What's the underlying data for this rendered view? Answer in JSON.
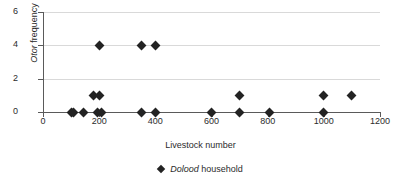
{
  "chart_data": {
    "type": "scatter",
    "title": "",
    "xlabel": "Livestock number",
    "ylabel_italic": "Otor",
    "ylabel_rest": " frequency",
    "ylabel": "Otor frequency",
    "xlim": [
      0,
      1200
    ],
    "ylim": [
      0,
      6
    ],
    "xticks": [
      0,
      200,
      400,
      600,
      800,
      1000,
      1200
    ],
    "xticklabels": [
      "0",
      "200",
      "400",
      "600",
      "800",
      "1000",
      "1200"
    ],
    "yticks": [
      0,
      2,
      4,
      6
    ],
    "yticklabels": [
      "0",
      "2",
      "4",
      "6"
    ],
    "gridlines_y": [
      2,
      4,
      6
    ],
    "grid": true,
    "legend_position": "bottom",
    "series": [
      {
        "name_italic": "Dolood",
        "name_rest": " household",
        "name": "Dolood household",
        "marker": "diamond",
        "color": "#232323",
        "points": [
          {
            "x": 100,
            "y": 0
          },
          {
            "x": 110,
            "y": 0
          },
          {
            "x": 145,
            "y": 0
          },
          {
            "x": 195,
            "y": 0
          },
          {
            "x": 210,
            "y": 0
          },
          {
            "x": 350,
            "y": 0
          },
          {
            "x": 400,
            "y": 0
          },
          {
            "x": 600,
            "y": 0
          },
          {
            "x": 700,
            "y": 0
          },
          {
            "x": 805,
            "y": 0
          },
          {
            "x": 1000,
            "y": 0
          },
          {
            "x": 180,
            "y": 1
          },
          {
            "x": 200,
            "y": 1
          },
          {
            "x": 700,
            "y": 1
          },
          {
            "x": 1000,
            "y": 1
          },
          {
            "x": 1100,
            "y": 1
          },
          {
            "x": 200,
            "y": 4
          },
          {
            "x": 350,
            "y": 4
          },
          {
            "x": 400,
            "y": 4
          }
        ]
      }
    ]
  }
}
